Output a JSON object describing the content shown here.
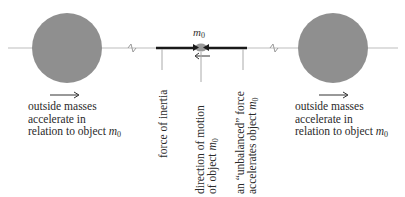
{
  "diagram": {
    "object_label": "m",
    "object_subscript": "0",
    "left_caption": {
      "line1": "outside masses",
      "line2": "accelerate in",
      "line3_prefix": "relation to object ",
      "var": "m",
      "sub": "0"
    },
    "right_caption": {
      "line1": "outside masses",
      "line2": "accelerate in",
      "line3_prefix": "relation to object ",
      "var": "m",
      "sub": "0"
    },
    "labels": {
      "force_of_inertia": "force of inertia",
      "direction_line1": "direction of motion",
      "direction_line2_prefix": "of object ",
      "unbalanced_line1": "an “unbalanced” force",
      "unbalanced_line2_prefix": "accelerates object ",
      "var": "m",
      "sub": "0"
    },
    "colors": {
      "sphere": "#8f8f8f",
      "axis_line": "#bdbdbd",
      "force_line": "#1a1a1a",
      "text": "#2a2a2a"
    }
  }
}
